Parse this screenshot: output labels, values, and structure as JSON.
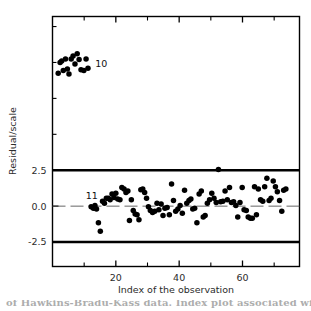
{
  "chart_data": {
    "type": "scatter",
    "title": "",
    "xlabel": "Index of the observation",
    "ylabel": "Residual/scale",
    "xlim": [
      0,
      78
    ],
    "ylim": [
      -4.2,
      13.2
    ],
    "grid": false,
    "legend": "none",
    "xticks": [
      20,
      40,
      60
    ],
    "xtick_labels": [
      "20",
      "40",
      "60"
    ],
    "xminor_ticks": [
      10,
      30,
      50,
      70
    ],
    "yticks": [
      2.5,
      0.0,
      -2.5
    ],
    "ytick_labels": [
      "2.5",
      "0.0",
      "-2.5"
    ],
    "yminor_ticks": [
      12.5,
      10.0,
      7.5,
      5.0
    ],
    "reference_lines": [
      {
        "y": 2.5,
        "style": "solid-thick",
        "color": "#000000"
      },
      {
        "y": -2.5,
        "style": "solid-thick",
        "color": "#000000"
      },
      {
        "y": 0.0,
        "style": "dashed-thin",
        "color": "#555555"
      }
    ],
    "annotations": [
      {
        "text": "10",
        "x": 13.5,
        "y": 9.9
      },
      {
        "text": "11",
        "x": 10.5,
        "y": 0.75
      }
    ],
    "series": [
      {
        "name": "outliers",
        "marker": "filled-circle",
        "color": "#000000",
        "points": [
          [
            1.8,
            9.25
          ],
          [
            2.4,
            10.0
          ],
          [
            2.9,
            10.1
          ],
          [
            3.4,
            9.45
          ],
          [
            4.1,
            10.25
          ],
          [
            4.7,
            9.55
          ],
          [
            5.2,
            9.2
          ],
          [
            5.9,
            10.25
          ],
          [
            6.5,
            10.45
          ],
          [
            7.1,
            9.9
          ],
          [
            7.8,
            10.6
          ],
          [
            8.4,
            10.2
          ],
          [
            9.0,
            9.5
          ],
          [
            9.9,
            9.45
          ],
          [
            10.6,
            10.25
          ],
          [
            11.2,
            9.6
          ]
        ]
      },
      {
        "name": "regular-observations",
        "marker": "filled-circle",
        "color": "#000000",
        "points": [
          [
            12.2,
            -0.05
          ],
          [
            12.9,
            -0.15
          ],
          [
            13.4,
            0.05
          ],
          [
            13.9,
            -0.2
          ],
          [
            14.5,
            -1.15
          ],
          [
            15.1,
            -1.75
          ],
          [
            15.8,
            0.35
          ],
          [
            16.4,
            0.2
          ],
          [
            17.0,
            0.55
          ],
          [
            17.6,
            0.55
          ],
          [
            18.2,
            0.45
          ],
          [
            18.8,
            0.85
          ],
          [
            19.4,
            0.6
          ],
          [
            20.0,
            0.9
          ],
          [
            20.6,
            0.5
          ],
          [
            21.3,
            0.45
          ],
          [
            21.9,
            1.3
          ],
          [
            22.6,
            1.2
          ],
          [
            23.2,
            0.95
          ],
          [
            23.8,
            1.05
          ],
          [
            24.3,
            -1.0
          ],
          [
            24.9,
            0.45
          ],
          [
            25.5,
            -0.3
          ],
          [
            26.1,
            -0.55
          ],
          [
            26.7,
            -0.6
          ],
          [
            27.3,
            -0.95
          ],
          [
            27.9,
            1.15
          ],
          [
            28.5,
            1.2
          ],
          [
            29.1,
            0.95
          ],
          [
            29.7,
            0.55
          ],
          [
            30.3,
            -0.05
          ],
          [
            30.9,
            -0.3
          ],
          [
            31.6,
            -0.45
          ],
          [
            32.3,
            -0.35
          ],
          [
            33.0,
            0.2
          ],
          [
            33.6,
            -0.25
          ],
          [
            34.3,
            0.15
          ],
          [
            34.9,
            -0.65
          ],
          [
            35.5,
            -0.15
          ],
          [
            36.2,
            -0.1
          ],
          [
            36.9,
            -0.6
          ],
          [
            37.6,
            1.55
          ],
          [
            38.2,
            0.4
          ],
          [
            38.9,
            -0.35
          ],
          [
            39.6,
            -0.2
          ],
          [
            40.3,
            0.05
          ],
          [
            41.0,
            -0.5
          ],
          [
            41.7,
            1.1
          ],
          [
            42.4,
            0.2
          ],
          [
            43.1,
            0.4
          ],
          [
            43.7,
            0.5
          ],
          [
            44.3,
            -0.2
          ],
          [
            44.9,
            -0.15
          ],
          [
            45.6,
            -1.15
          ],
          [
            46.3,
            0.85
          ],
          [
            47.0,
            1.05
          ],
          [
            47.6,
            -0.75
          ],
          [
            48.2,
            -0.65
          ],
          [
            48.9,
            0.2
          ],
          [
            49.6,
            0.45
          ],
          [
            50.3,
            0.9
          ],
          [
            51.0,
            0.55
          ],
          [
            51.7,
            0.25
          ],
          [
            52.4,
            2.55
          ],
          [
            53.1,
            0.3
          ],
          [
            53.8,
            0.35
          ],
          [
            54.5,
            1.05
          ],
          [
            55.2,
            0.45
          ],
          [
            55.9,
            1.3
          ],
          [
            56.5,
            0.25
          ],
          [
            57.2,
            0.3
          ],
          [
            57.9,
            0.05
          ],
          [
            58.5,
            -0.75
          ],
          [
            59.2,
            0.25
          ],
          [
            59.9,
            1.3
          ],
          [
            60.5,
            -0.25
          ],
          [
            61.2,
            -0.3
          ],
          [
            61.8,
            -0.75
          ],
          [
            62.5,
            -0.85
          ],
          [
            63.1,
            -0.85
          ],
          [
            63.8,
            1.35
          ],
          [
            64.4,
            -0.6
          ],
          [
            65.0,
            1.2
          ],
          [
            65.7,
            0.45
          ],
          [
            66.4,
            0.35
          ],
          [
            67.0,
            1.35
          ],
          [
            67.7,
            1.95
          ],
          [
            68.4,
            0.4
          ],
          [
            69.0,
            0.55
          ],
          [
            69.7,
            1.75
          ],
          [
            70.4,
            1.35
          ],
          [
            71.0,
            1.0
          ],
          [
            71.7,
            0.4
          ],
          [
            72.4,
            -0.35
          ],
          [
            73.0,
            1.1
          ],
          [
            73.7,
            1.2
          ]
        ]
      }
    ]
  },
  "figure": {
    "y_axis_title": "Residual/scale",
    "x_axis_title": "Index of the observation",
    "caption": "of Hawkins-Bradu-Kass data. Index plot associated with MM-"
  }
}
